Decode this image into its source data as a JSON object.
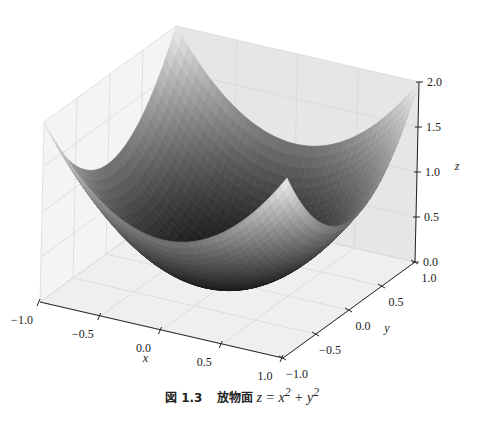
{
  "chart_data": {
    "type": "surface3d",
    "title": "",
    "function": "z = x^2 + y^2",
    "surface_name": "放物面",
    "x": {
      "label": "x",
      "range": [
        -1.0,
        1.0
      ],
      "ticks": [
        -1.0,
        -0.5,
        0.0,
        0.5,
        1.0
      ],
      "tick_labels": [
        "−1.0",
        "−0.5",
        "0.0",
        "0.5",
        "1.0"
      ]
    },
    "y": {
      "label": "y",
      "range": [
        -1.0,
        1.0
      ],
      "ticks": [
        -1.0,
        -0.5,
        0.0,
        0.5,
        1.0
      ],
      "tick_labels": [
        "−1.0",
        "−0.5",
        "0.0",
        "0.5",
        "1.0"
      ]
    },
    "z": {
      "label": "z",
      "range": [
        0.0,
        2.0
      ],
      "ticks": [
        0.0,
        0.5,
        1.0,
        1.5,
        2.0
      ],
      "tick_labels": [
        "0.0",
        "0.5",
        "1.0",
        "1.5",
        "2.0"
      ]
    },
    "grid": true,
    "colormap": "gray",
    "pane_color": "#ebebeb",
    "grid_color": "#d6d6d6",
    "axis_color": "#222222",
    "sample_points": [
      {
        "x": -1.0,
        "y": -1.0,
        "z": 2.0
      },
      {
        "x": 1.0,
        "y": -1.0,
        "z": 2.0
      },
      {
        "x": -1.0,
        "y": 1.0,
        "z": 2.0
      },
      {
        "x": 1.0,
        "y": 1.0,
        "z": 2.0
      },
      {
        "x": 0.0,
        "y": 0.0,
        "z": 0.0
      },
      {
        "x": 1.0,
        "y": 0.0,
        "z": 1.0
      },
      {
        "x": 0.0,
        "y": 1.0,
        "z": 1.0
      }
    ]
  },
  "caption": {
    "prefix": "図 1.3",
    "text": "放物面",
    "math_lhs": "z = x",
    "math_mid": " + y",
    "sup": "2"
  }
}
